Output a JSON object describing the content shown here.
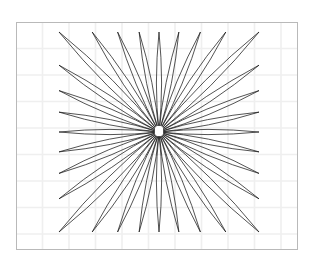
{
  "figure": {
    "name": "radial-petal-rosette",
    "title": "Radial petal rosette diagram",
    "canvas": {
      "width": 318,
      "height": 258,
      "background": "#ffffff"
    },
    "frame": {
      "name": "plot-frame",
      "x": 16,
      "y": 22,
      "width": 282,
      "height": 228,
      "stroke": "#b9b9b9",
      "stroke_width": 1,
      "fill": "#ffffff"
    },
    "grid": {
      "visible": true,
      "spacing": 26.5,
      "stroke": "#efefef",
      "stroke_width": 1.6,
      "orientation": "both"
    },
    "rosette": {
      "center_x": 159,
      "center_y": 132,
      "petal_count": 32,
      "envelope": "square",
      "half_extent": 100,
      "petal_waist": 0.052,
      "stroke": "#1a1a1a",
      "stroke_width": 0.75,
      "fill": "none",
      "rotation_offset": 0
    },
    "hub": {
      "name": "center-hole",
      "cx": 159,
      "cy": 131,
      "width": 9,
      "height": 11,
      "corner_radius": 3,
      "fill": "#ffffff",
      "stroke": "#2b2b2b",
      "stroke_width": 0.7
    }
  }
}
